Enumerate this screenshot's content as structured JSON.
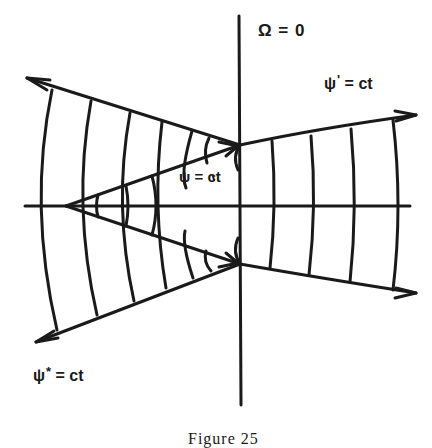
{
  "figure": {
    "caption": "Figure 25",
    "labels": {
      "omega": "Ω = 0",
      "psi_prime_base": "ψ",
      "psi_prime_mark": "'",
      "psi_prime_rest": " = ct",
      "psi": "ψ = ct",
      "psi_star_base": "ψ",
      "psi_star_mark": "*",
      "psi_star_rest": " = ct"
    },
    "colors": {
      "ink": "#1a1a1a",
      "background": "#ffffff"
    },
    "elements": {
      "axes": [
        "horizontal-axis",
        "vertical-axis"
      ],
      "outer_rays": [
        "upper-left-ray",
        "lower-left-ray",
        "upper-right-ray",
        "lower-right-ray"
      ],
      "inner_wedge": [
        "inner-upper-ray",
        "inner-lower-ray"
      ],
      "arc_families": [
        "left-outer-arcs",
        "inner-wedge-arcs",
        "right-arcs"
      ]
    }
  }
}
